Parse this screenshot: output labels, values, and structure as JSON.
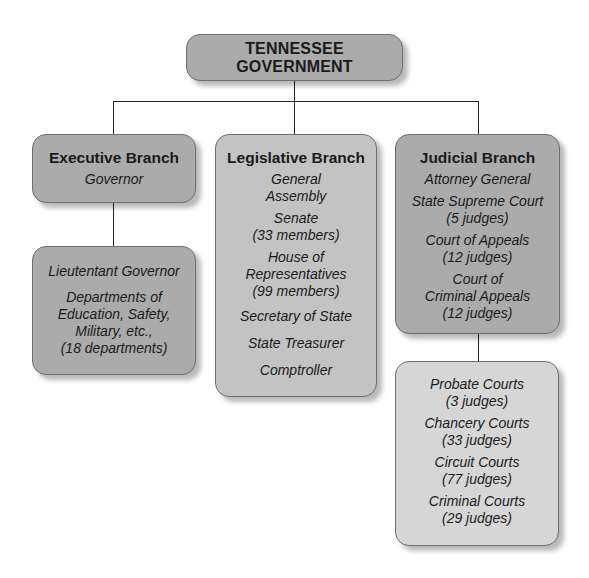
{
  "root": {
    "title": "TENNESSEE GOVERNMENT"
  },
  "branches": [
    {
      "title": "Executive Branch",
      "items": [
        "Governor"
      ],
      "sub": {
        "items": [
          "Lieutentant Governor",
          "Departments of Education, Safety, Military, etc., (18 departments)"
        ],
        "lines": [
          [
            "Lieutentant Governor"
          ],
          [
            "Departments of",
            "Education, Safety,",
            "Military, etc.,",
            "(18 departments)"
          ]
        ]
      }
    },
    {
      "title": "Legislative Branch",
      "lines": [
        [
          "General",
          "Assembly"
        ],
        [
          "Senate",
          "(33 members)"
        ],
        [
          "House of",
          "Representatives",
          "(99 members)"
        ],
        [
          "Secretary of State"
        ],
        [
          "State Treasurer"
        ],
        [
          "Comptroller"
        ]
      ]
    },
    {
      "title": "Judicial Branch",
      "lines": [
        [
          "Attorney General"
        ],
        [
          "State Supreme Court",
          "(5 judges)"
        ],
        [
          "Court of Appeals",
          "(12 judges)"
        ],
        [
          "Court of",
          "Criminal Appeals",
          "(12 judges)"
        ]
      ],
      "sub": {
        "lines": [
          [
            "Probate Courts",
            "(3 judges)"
          ],
          [
            "Chancery Courts",
            "(33 judges)"
          ],
          [
            "Circuit Courts",
            "(77 judges)"
          ],
          [
            "Criminal Courts",
            "(29 judges)"
          ]
        ]
      }
    }
  ],
  "colors": {
    "dark_box": "#ababab",
    "mid_box": "#c3c3c3",
    "light_box": "#d6d6d6",
    "connector": "#222222"
  }
}
